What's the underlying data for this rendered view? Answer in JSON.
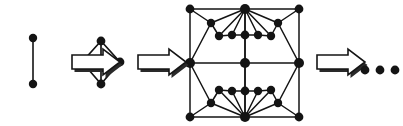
{
  "figure": {
    "type": "diagram",
    "width": 403,
    "height": 126,
    "background_color": "#ffffff",
    "ink_color": "#141414",
    "ellipsis_text": "..."
  },
  "stages": [
    {
      "index": 1,
      "name": "single-edge-graph",
      "label": "",
      "node_count": 2,
      "edge_count": 1,
      "nodes": [
        {
          "id": "a",
          "x": 33,
          "y": 38,
          "r": 4.2
        },
        {
          "id": "b",
          "x": 33,
          "y": 84,
          "r": 4.2
        }
      ],
      "edges": [
        {
          "from": "a",
          "to": "b",
          "width": 1.6
        }
      ]
    },
    {
      "index": 2,
      "name": "diamond-graph",
      "label": "",
      "node_count": 5,
      "edge_count": 6,
      "nodes": [
        {
          "id": "t",
          "x": 101,
          "y": 41,
          "r": 4.4
        },
        {
          "id": "l",
          "x": 82,
          "y": 62,
          "r": 4.4
        },
        {
          "id": "c",
          "x": 101,
          "y": 62,
          "r": 4.4
        },
        {
          "id": "r",
          "x": 120,
          "y": 62,
          "r": 4.4
        },
        {
          "id": "b",
          "x": 101,
          "y": 84,
          "r": 4.4
        }
      ],
      "edges": [
        {
          "from": "t",
          "to": "l",
          "width": 1.7
        },
        {
          "from": "t",
          "to": "r",
          "width": 1.7
        },
        {
          "from": "t",
          "to": "c",
          "width": 1.7
        },
        {
          "from": "l",
          "to": "b",
          "width": 1.7
        },
        {
          "from": "r",
          "to": "b",
          "width": 1.7
        },
        {
          "from": "c",
          "to": "b",
          "width": 1.7
        }
      ]
    },
    {
      "index": 3,
      "name": "large-square-octagon-graph",
      "label": "",
      "node_count": 21,
      "edge_count": 44,
      "nodes": [
        {
          "id": "sq_tl",
          "x": 190,
          "y": 9,
          "r": 4.4
        },
        {
          "id": "sq_tr",
          "x": 299,
          "y": 9,
          "r": 4.4
        },
        {
          "id": "sq_bl",
          "x": 190,
          "y": 117,
          "r": 4.4
        },
        {
          "id": "sq_br",
          "x": 299,
          "y": 117,
          "r": 4.4
        },
        {
          "id": "top",
          "x": 245,
          "y": 9,
          "r": 5.0
        },
        {
          "id": "bottom",
          "x": 245,
          "y": 117,
          "r": 5.0
        },
        {
          "id": "left",
          "x": 190,
          "y": 63,
          "r": 5.0
        },
        {
          "id": "right",
          "x": 299,
          "y": 63,
          "r": 5.0
        },
        {
          "id": "oct_tl",
          "x": 211,
          "y": 23,
          "r": 4.2
        },
        {
          "id": "oct_tr",
          "x": 278,
          "y": 23,
          "r": 4.2
        },
        {
          "id": "oct_bl",
          "x": 211,
          "y": 103,
          "r": 4.2
        },
        {
          "id": "oct_br",
          "x": 278,
          "y": 103,
          "r": 4.2
        },
        {
          "id": "in_t1",
          "x": 219,
          "y": 36,
          "r": 4.2
        },
        {
          "id": "in_t2",
          "x": 232,
          "y": 35,
          "r": 4.2
        },
        {
          "id": "in_t3",
          "x": 245,
          "y": 35,
          "r": 4.4
        },
        {
          "id": "in_t4",
          "x": 258,
          "y": 35,
          "r": 4.2
        },
        {
          "id": "in_t5",
          "x": 271,
          "y": 36,
          "r": 4.2
        },
        {
          "id": "in_b1",
          "x": 219,
          "y": 90,
          "r": 4.2
        },
        {
          "id": "in_b2",
          "x": 232,
          "y": 91,
          "r": 4.2
        },
        {
          "id": "in_b3",
          "x": 245,
          "y": 91,
          "r": 4.4
        },
        {
          "id": "in_b4",
          "x": 258,
          "y": 91,
          "r": 4.2
        },
        {
          "id": "in_b5",
          "x": 271,
          "y": 90,
          "r": 4.2
        },
        {
          "id": "center",
          "x": 245,
          "y": 63,
          "r": 5.0
        }
      ],
      "edges": [
        {
          "from": "sq_tl",
          "to": "top"
        },
        {
          "from": "top",
          "to": "sq_tr"
        },
        {
          "from": "sq_tl",
          "to": "left"
        },
        {
          "from": "left",
          "to": "sq_bl"
        },
        {
          "from": "sq_tr",
          "to": "right"
        },
        {
          "from": "right",
          "to": "sq_br"
        },
        {
          "from": "sq_bl",
          "to": "bottom"
        },
        {
          "from": "bottom",
          "to": "sq_br"
        },
        {
          "from": "left",
          "to": "oct_tl"
        },
        {
          "from": "oct_tl",
          "to": "in_t1"
        },
        {
          "from": "in_t1",
          "to": "in_t2"
        },
        {
          "from": "in_t2",
          "to": "in_t3"
        },
        {
          "from": "in_t3",
          "to": "in_t4"
        },
        {
          "from": "in_t4",
          "to": "in_t5"
        },
        {
          "from": "in_t5",
          "to": "oct_tr"
        },
        {
          "from": "oct_tr",
          "to": "right"
        },
        {
          "from": "left",
          "to": "oct_bl"
        },
        {
          "from": "oct_bl",
          "to": "in_b1"
        },
        {
          "from": "in_b1",
          "to": "in_b2"
        },
        {
          "from": "in_b2",
          "to": "in_b3"
        },
        {
          "from": "in_b3",
          "to": "in_b4"
        },
        {
          "from": "in_b4",
          "to": "in_b5"
        },
        {
          "from": "in_b5",
          "to": "oct_br"
        },
        {
          "from": "oct_br",
          "to": "right"
        },
        {
          "from": "top",
          "to": "oct_tl"
        },
        {
          "from": "top",
          "to": "in_t1"
        },
        {
          "from": "top",
          "to": "in_t2"
        },
        {
          "from": "top",
          "to": "in_t3"
        },
        {
          "from": "top",
          "to": "in_t4"
        },
        {
          "from": "top",
          "to": "in_t5"
        },
        {
          "from": "top",
          "to": "oct_tr"
        },
        {
          "from": "bottom",
          "to": "oct_bl"
        },
        {
          "from": "bottom",
          "to": "in_b1"
        },
        {
          "from": "bottom",
          "to": "in_b2"
        },
        {
          "from": "bottom",
          "to": "in_b3"
        },
        {
          "from": "bottom",
          "to": "in_b4"
        },
        {
          "from": "bottom",
          "to": "in_b5"
        },
        {
          "from": "bottom",
          "to": "oct_br"
        },
        {
          "from": "top",
          "to": "center"
        },
        {
          "from": "center",
          "to": "bottom"
        },
        {
          "from": "left",
          "to": "center"
        },
        {
          "from": "center",
          "to": "right"
        },
        {
          "from": "center",
          "to": "in_t3"
        },
        {
          "from": "center",
          "to": "in_b3"
        },
        {
          "from": "sq_tl",
          "to": "oct_tl"
        },
        {
          "from": "sq_tr",
          "to": "oct_tr"
        },
        {
          "from": "sq_bl",
          "to": "oct_bl"
        },
        {
          "from": "sq_br",
          "to": "oct_br"
        }
      ]
    }
  ],
  "arrows": [
    {
      "index": 1,
      "name": "arrow-1",
      "x": 72,
      "y": 62,
      "length": 48,
      "direction": "right"
    },
    {
      "index": 2,
      "name": "arrow-2",
      "x": 138,
      "y": 62,
      "length": 48,
      "direction": "right"
    },
    {
      "index": 3,
      "name": "arrow-3",
      "x": 317,
      "y": 62,
      "length": 48,
      "direction": "right"
    }
  ],
  "ellipsis": {
    "name": "ellipsis-dots",
    "dot_count": 3,
    "dots": [
      {
        "x": 365,
        "y": 70,
        "r": 4.4
      },
      {
        "x": 380,
        "y": 70,
        "r": 4.4
      },
      {
        "x": 395,
        "y": 70,
        "r": 4.4
      }
    ]
  }
}
